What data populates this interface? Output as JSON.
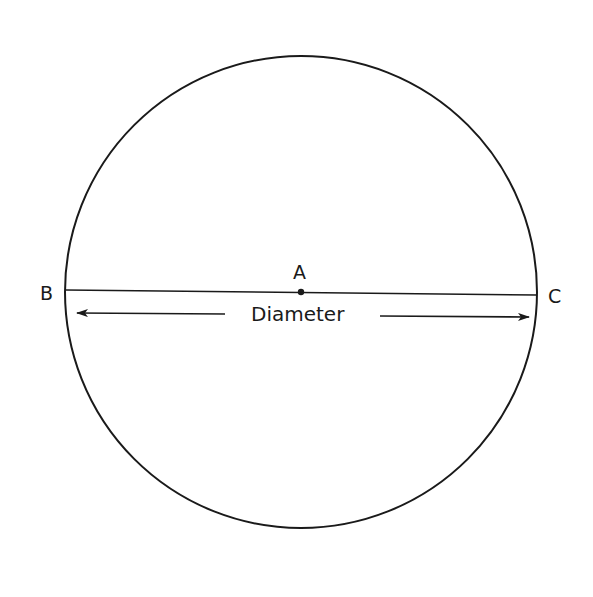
{
  "diagram": {
    "type": "geometry-circle-diameter",
    "colors": {
      "stroke": "#1a1a1a",
      "background": "#ffffff"
    },
    "circle": {
      "cx": 301,
      "cy": 292,
      "r": 236
    },
    "points": {
      "center": {
        "label": "A",
        "x": 301,
        "y": 292
      },
      "left": {
        "label": "B",
        "x": 66,
        "y": 290
      },
      "right": {
        "label": "C",
        "x": 537,
        "y": 295
      }
    },
    "diameter_label": "Diameter"
  }
}
